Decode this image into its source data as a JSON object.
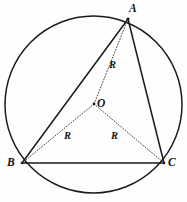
{
  "figure": {
    "name": "circumscribed-circle-triangle",
    "background_color": "#fefefe",
    "stroke_color": "#1a1a1a",
    "dotted_stroke_color": "#4a4a4a",
    "width": 187,
    "height": 202
  },
  "circle": {
    "center_x": 93.5,
    "center_y": 104.5,
    "radius": 88.5,
    "style": "solid",
    "stroke_width": 1.5
  },
  "points": {
    "A": {
      "label": "A",
      "x": 128,
      "y": 19,
      "label_x": 129,
      "label_y": 3
    },
    "B": {
      "label": "B",
      "x": 22,
      "y": 163,
      "label_x": 7,
      "label_y": 157
    },
    "C": {
      "label": "C",
      "x": 164,
      "y": 163,
      "label_x": 168,
      "label_y": 157
    },
    "O": {
      "label": "O",
      "x": 94,
      "y": 104,
      "label_x": 97,
      "label_y": 98
    }
  },
  "triangle_sides": [
    {
      "name": "side-ab",
      "from": "A",
      "to": "B",
      "style": "solid"
    },
    {
      "name": "side-bc",
      "from": "B",
      "to": "C",
      "style": "solid"
    },
    {
      "name": "side-ca",
      "from": "C",
      "to": "A",
      "style": "solid"
    }
  ],
  "radii": [
    {
      "name": "radius-oa",
      "from": "O",
      "to": "A",
      "style": "dotted",
      "label": "R",
      "label_x": 109,
      "label_y": 60
    },
    {
      "name": "radius-ob",
      "from": "O",
      "to": "B",
      "style": "dotted",
      "label": "R",
      "label_x": 64,
      "label_y": 131
    },
    {
      "name": "radius-oc",
      "from": "O",
      "to": "C",
      "style": "dotted",
      "label": "R",
      "label_x": 111,
      "label_y": 131
    }
  ]
}
